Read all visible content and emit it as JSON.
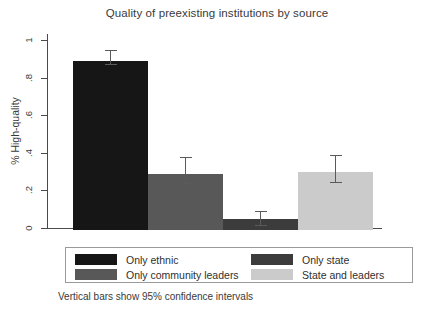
{
  "chart_data": {
    "type": "bar",
    "title": "Quality of preexisting institutions by source",
    "xlabel": "",
    "ylabel": "% High-quality",
    "ylim": [
      0,
      1.05
    ],
    "grid": false,
    "legend_position": "below-plot",
    "ytick_labels": [
      "0",
      ".2",
      ".4",
      ".6",
      ".8",
      "1"
    ],
    "ytick_values": [
      0,
      0.2,
      0.4,
      0.6,
      0.8,
      1
    ],
    "categories": [
      "Only ethnic",
      "Only community leaders",
      "Only state",
      "State and leaders"
    ],
    "values": [
      0.9,
      0.3,
      0.06,
      0.31
    ],
    "errors_low": [
      0.88,
      0.245,
      0.02,
      0.25
    ],
    "errors_high": [
      0.96,
      0.39,
      0.1,
      0.4
    ],
    "colors": [
      "#161616",
      "#585858",
      "#3c3c3c",
      "#cbcbcb"
    ],
    "annotation": "Vertical bars show 95% confidence intervals",
    "error_note": "Vertical bars show 95% confidence intervals"
  },
  "legend": {
    "entries": [
      {
        "label": "Only ethnic",
        "color": "#161616"
      },
      {
        "label": "Only state",
        "color": "#3c3c3c"
      },
      {
        "label": "Only community leaders",
        "color": "#585858"
      },
      {
        "label": "State and leaders",
        "color": "#cbcbcb"
      }
    ]
  },
  "footnote": {
    "text": "Vertical bars show 95% confidence intervals"
  },
  "axis": {
    "y_title": "% High-quality"
  }
}
